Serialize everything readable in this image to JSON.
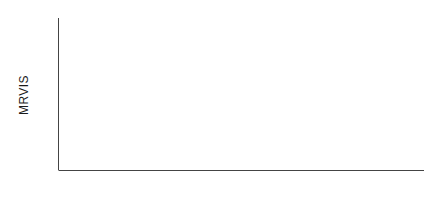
{
  "chart_data": {
    "type": "line",
    "title": "",
    "subtitle": "",
    "xlabel": "",
    "ylabel": "MRVIS",
    "ylim": [
      55,
      122
    ],
    "xlim": [
      0,
      44
    ],
    "grid": false,
    "legend": null,
    "y_major_ticks": [
      60,
      80,
      100,
      120
    ],
    "y_minor_ticks": [
      70,
      90,
      110
    ],
    "y_tick_labels": [
      "60",
      "80",
      "100",
      "120"
    ],
    "x_tick_positions": [
      14.5,
      26.5
    ],
    "x_tick_labels": [
      "1979",
      "1980",
      "1981"
    ],
    "x_label_positions": [
      8.5,
      20.5,
      32.5
    ],
    "marker": "open-circle",
    "series": [
      {
        "name": "MRVIS",
        "x": [
          0,
          1,
          2,
          3,
          4,
          5,
          6,
          7,
          8,
          9,
          10,
          11,
          12,
          13,
          14,
          15,
          16,
          17,
          18,
          19,
          20,
          21,
          22,
          23,
          24,
          25,
          26,
          27,
          28,
          29,
          30,
          31,
          32,
          33,
          34,
          35,
          36,
          37,
          38,
          39,
          40,
          41,
          42,
          43,
          44
        ],
        "values": [
          85.0,
          99.5,
          90.5,
          102.0,
          93.0,
          84.0,
          117.0,
          102.5,
          96.5,
          89.0,
          88.5,
          83.0,
          86.0,
          85.5,
          90.5,
          84.0,
          82.5,
          80.0,
          82.0,
          83.5,
          83.0,
          79.5,
          73.5,
          78.0,
          72.5,
          75.0,
          76.0,
          75.0,
          72.5,
          76.0,
          75.5,
          69.5,
          73.0,
          72.0,
          71.5,
          70.0,
          69.0,
          68.5,
          68.0,
          67.5,
          66.0,
          64.5,
          63.0,
          61.5,
          61.0
        ]
      }
    ]
  },
  "axes": {
    "y_axis_name": "MRVIS",
    "x_axis_name": ""
  }
}
